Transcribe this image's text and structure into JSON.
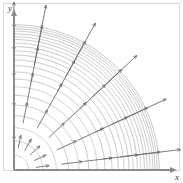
{
  "figure": {
    "title": "",
    "axis_x_label": "x",
    "axis_y_label": "y",
    "origin": {
      "x": 14,
      "y": 170
    },
    "frame": {
      "x": 3,
      "y": 3,
      "width": 177,
      "height": 168
    },
    "colors": {
      "background": "#ffffff",
      "frame": "#d9d9d9",
      "axis": "#8c8c8c",
      "level_curve": "#b9b9b9",
      "vector": "#6e6e6e",
      "label": "#3a3a3a"
    }
  },
  "chart_data": {
    "type": "line",
    "title": "",
    "subtitle": "",
    "xlabel": "x",
    "ylabel": "y",
    "grid": false,
    "legend": "none",
    "quadrant": "first",
    "center": [
      0,
      0
    ],
    "xlim": [
      0,
      11.8
    ],
    "ylim": [
      0,
      11.2
    ],
    "level_curves": {
      "kind": "concentric-circles",
      "center": [
        0,
        0
      ],
      "count": 22,
      "radii": [
        1.05,
        2.05,
        3.0,
        3.85,
        4.6,
        5.3,
        5.9,
        6.45,
        6.95,
        7.4,
        7.8,
        8.15,
        8.45,
        8.75,
        9.0,
        9.25,
        9.45,
        9.65,
        9.85,
        10.0,
        10.15,
        10.3
      ],
      "note": "Radii are spaced for equal increments of the function value, so curves crowd together at large radius."
    },
    "vectors": {
      "kind": "gradient-arrows",
      "direction": "radially outward",
      "count": 36,
      "sample_radii": [
        1.6,
        3.4,
        5.0,
        6.4,
        7.6,
        8.7
      ],
      "sample_angles_deg": [
        7,
        25,
        43,
        61,
        79,
        90
      ],
      "length_rule": "proportional to radius",
      "min_length": 0.9,
      "max_length": 3.2,
      "arrowhead": "open-v"
    },
    "series": [
      {
        "name": "level curve radii",
        "x": [
          1,
          2,
          3,
          4,
          5,
          6,
          7,
          8,
          9,
          10,
          11,
          12,
          13,
          14,
          15,
          16,
          17,
          18,
          19,
          20,
          21,
          22
        ],
        "values": [
          1.05,
          2.05,
          3.0,
          3.85,
          4.6,
          5.3,
          5.9,
          6.45,
          6.95,
          7.4,
          7.8,
          8.15,
          8.45,
          8.75,
          9.0,
          9.25,
          9.45,
          9.65,
          9.85,
          10.0,
          10.15,
          10.3
        ]
      },
      {
        "name": "gradient magnitude vs radius",
        "x": [
          1.6,
          3.4,
          5.0,
          6.4,
          7.6,
          8.7
        ],
        "values": [
          0.9,
          1.4,
          1.9,
          2.4,
          2.8,
          3.2
        ]
      }
    ]
  }
}
